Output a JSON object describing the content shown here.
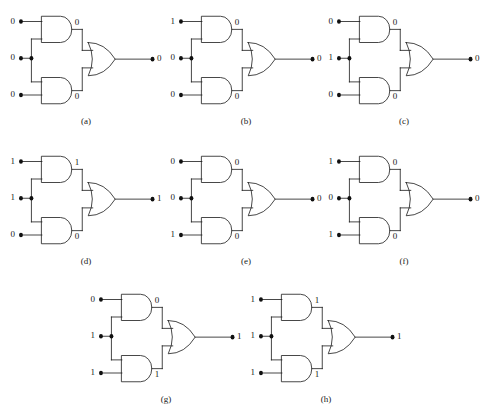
{
  "figure": {
    "background_color": "#ffffff",
    "line_color": "#1d1d1d"
  },
  "geometry": {
    "input_label_x": 4,
    "and_output_label_dx": 4,
    "or_output_label_dx": 6
  },
  "circuits": [
    {
      "id": "a",
      "caption": "(a)",
      "inputs": {
        "top": "0",
        "middle": "0",
        "bottom": "0"
      },
      "and_outputs": {
        "top": "0",
        "bottom": "0"
      },
      "output": "0"
    },
    {
      "id": "b",
      "caption": "(b)",
      "inputs": {
        "top": "1",
        "middle": "0",
        "bottom": "0"
      },
      "and_outputs": {
        "top": "0",
        "bottom": "0"
      },
      "output": "0"
    },
    {
      "id": "c",
      "caption": "(c)",
      "inputs": {
        "top": "0",
        "middle": "1",
        "bottom": "0"
      },
      "and_outputs": {
        "top": "0",
        "bottom": "0"
      },
      "output": "0"
    },
    {
      "id": "d",
      "caption": "(d)",
      "inputs": {
        "top": "1",
        "middle": "1",
        "bottom": "0"
      },
      "and_outputs": {
        "top": "1",
        "bottom": "0"
      },
      "output": "1"
    },
    {
      "id": "e",
      "caption": "(e)",
      "inputs": {
        "top": "0",
        "middle": "0",
        "bottom": "1"
      },
      "and_outputs": {
        "top": "0",
        "bottom": "0"
      },
      "output": "0"
    },
    {
      "id": "f",
      "caption": "(f)",
      "inputs": {
        "top": "1",
        "middle": "0",
        "bottom": "1"
      },
      "and_outputs": {
        "top": "0",
        "bottom": "0"
      },
      "output": "0"
    },
    {
      "id": "g",
      "caption": "(g)",
      "inputs": {
        "top": "0",
        "middle": "1",
        "bottom": "1"
      },
      "and_outputs": {
        "top": "0",
        "bottom": "1"
      },
      "output": "1"
    },
    {
      "id": "h",
      "caption": "(h)",
      "inputs": {
        "top": "1",
        "middle": "1",
        "bottom": "1"
      },
      "and_outputs": {
        "top": "1",
        "bottom": "1"
      },
      "output": "1"
    }
  ]
}
